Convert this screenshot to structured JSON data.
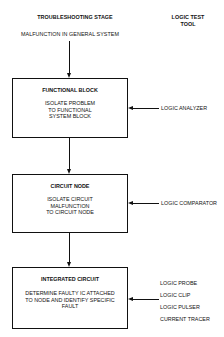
{
  "header": {
    "stage_title": "TROUBLESHOOTING STAGE",
    "tool_title_line1": "LOGIC TEST",
    "tool_title_line2": "TOOL",
    "start_label": "MALFUNCTION IN GENERAL SYSTEM"
  },
  "stages": [
    {
      "title": "FUNCTIONAL BLOCK",
      "description": [
        "ISOLATE PROBLEM",
        "TO FUNCTIONAL",
        "SYSTEM BLOCK"
      ],
      "tools": [
        "LOGIC ANALYZER"
      ]
    },
    {
      "title": "CIRCUIT NODE",
      "description": [
        "ISOLATE CIRCUIT",
        "MALFUNCTION",
        "TO CIRCUIT NODE"
      ],
      "tools": [
        "LOGIC COMPARATOR"
      ]
    },
    {
      "title": "INTEGRATED CIRCUIT",
      "description": [
        "DETERMINE FAULTY IC ATTACHED",
        "TO NODE AND IDENTIFY SPECIFIC",
        "FAULT"
      ],
      "tools": [
        "LOGIC PROBE",
        "LOGIC CLIP",
        "LOGIC PULSER",
        "CURRENT TRACER"
      ]
    }
  ],
  "colors": {
    "line": "#111111",
    "background": "#ffffff"
  }
}
